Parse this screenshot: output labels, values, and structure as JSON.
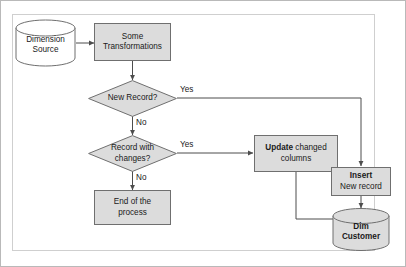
{
  "diagram": {
    "colors": {
      "shape_fill": "#dcdcdc",
      "shape_stroke": "#6f6f6f",
      "line": "#4d4d4d",
      "frame": "#cfcfcf",
      "text": "#1a1a1a"
    },
    "nodes": {
      "source": {
        "shape": "cylinder",
        "line1": "Dimension",
        "line2": "Source"
      },
      "transform": {
        "shape": "process",
        "line1": "Some",
        "line2": "Transformations"
      },
      "new_record": {
        "shape": "decision",
        "line1": "New Record?"
      },
      "record_changes": {
        "shape": "decision",
        "line1": "Record with",
        "line2": "changes?"
      },
      "end_process": {
        "shape": "process",
        "line1": "End of the",
        "line2": "process"
      },
      "update": {
        "shape": "process",
        "strong": "Update",
        "rest": " changed",
        "line2": "columns"
      },
      "insert": {
        "shape": "process",
        "strong": "Insert",
        "line2": "New record"
      },
      "target": {
        "shape": "cylinder",
        "line1": "Dim",
        "line2": "Customer"
      }
    },
    "edges": {
      "new_record_yes": "Yes",
      "new_record_no": "No",
      "record_changes_yes": "Yes",
      "record_changes_no": "No"
    }
  }
}
